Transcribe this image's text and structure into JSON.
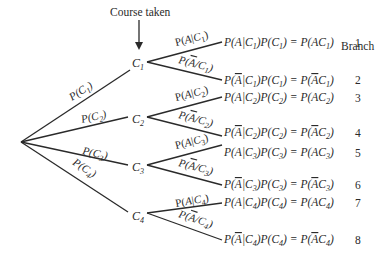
{
  "header": {
    "course_taken": "Course taken",
    "branch": "Branch"
  },
  "root": {
    "x": 21,
    "y": 142
  },
  "nodes": [
    {
      "label": "C",
      "sub": "1",
      "edge_label": "P(C1)",
      "edge_label_main": "P(C",
      "edge_label_sub": "1",
      "edge_label_end": ")"
    },
    {
      "label": "C",
      "sub": "2",
      "edge_label": "P(C2)",
      "edge_label_main": "P(C",
      "edge_label_sub": "2",
      "edge_label_end": ")"
    },
    {
      "label": "C",
      "sub": "3",
      "edge_label": "P(C3)",
      "edge_label_main": "P(C",
      "edge_label_sub": "3",
      "edge_label_end": ")"
    },
    {
      "label": "C",
      "sub": "4",
      "edge_label": "P(C4)",
      "edge_label_main": "P(C",
      "edge_label_sub": "4",
      "edge_label_end": ")"
    }
  ],
  "branches": [
    {
      "number": "1",
      "edge_label": "P(A|C1)",
      "equation": "P(A|C1)P(C1) = P(AC1)"
    },
    {
      "number": "2",
      "edge_label": "P(Ā|C1)",
      "equation": "P(Ā|C1)P(C1) = P(ĀC1)"
    },
    {
      "number": "3",
      "edge_label": "P(A|C2)",
      "equation": "P(A|C2)P(C2) = P(AC2)"
    },
    {
      "number": "4",
      "edge_label": "P(Ā|C2)",
      "equation": "P(Ā|C2)P(C2) = P(ĀC2)"
    },
    {
      "number": "5",
      "edge_label": "P(A|C3)",
      "equation": "P(A|C3)P(C3) = P(AC3)"
    },
    {
      "number": "6",
      "edge_label": "P(Ā|C3)",
      "equation": "P(Ā|C3)P(C3) = P(ĀC3)"
    },
    {
      "number": "7",
      "edge_label": "P(A|C4)",
      "equation": "P(A|C4)P(C4) = P(AC4)"
    },
    {
      "number": "8",
      "edge_label": "P(Ā|C4)",
      "equation": "P(Ā|C4)P(C4) = P(ĀC4)"
    }
  ],
  "parts": {
    "P": "P(",
    "A": "A",
    "Abar": "A",
    "bar": "|",
    "C": "C",
    "close": ")",
    "eq": " = ",
    "n1": "1",
    "n2": "2",
    "n3": "3",
    "n4": "4"
  }
}
